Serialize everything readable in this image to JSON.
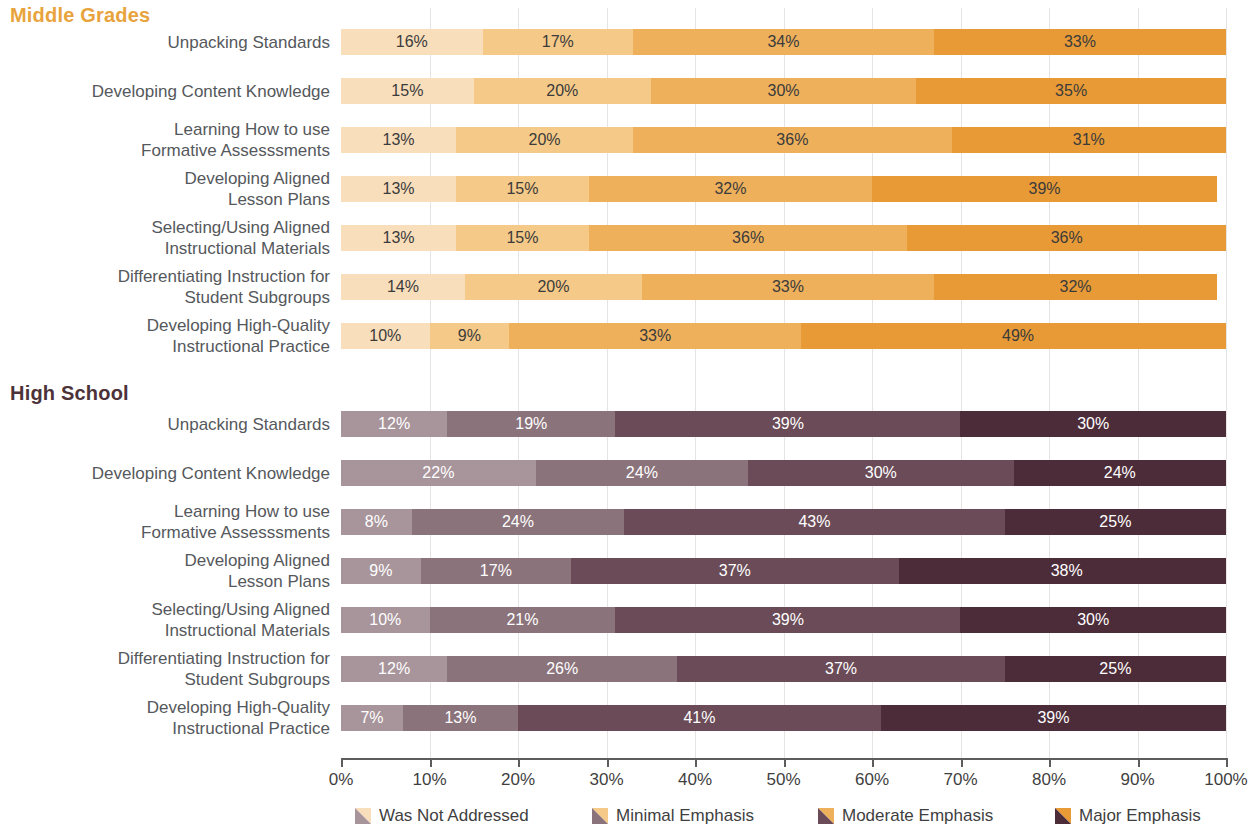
{
  "sections": [
    {
      "id": "middle-grades",
      "title": "Middle Grades",
      "title_color": "#e8a33d",
      "palette": [
        "#f8debb",
        "#f5c987",
        "#eeb05b",
        "#e79a36"
      ],
      "label_text_color": "#3b3b3b",
      "rows": [
        {
          "label": "Unpacking Standards",
          "values": [
            16,
            17,
            34,
            33
          ],
          "labels": [
            "16%",
            "17%",
            "34%",
            "33%"
          ]
        },
        {
          "label": "Developing Content Knowledge",
          "values": [
            15,
            20,
            30,
            35
          ],
          "labels": [
            "15%",
            "20%",
            "30%",
            "35%"
          ]
        },
        {
          "label": "Learning How to use\nFormative Assesssments",
          "values": [
            13,
            20,
            36,
            31
          ],
          "labels": [
            "13%",
            "20%",
            "36%",
            "31%"
          ]
        },
        {
          "label": "Developing Aligned\nLesson Plans",
          "values": [
            13,
            15,
            32,
            39
          ],
          "labels": [
            "13%",
            "15%",
            "32%",
            "39%"
          ]
        },
        {
          "label": "Selecting/Using Aligned\nInstructional Materials",
          "values": [
            13,
            15,
            36,
            36
          ],
          "labels": [
            "13%",
            "15%",
            "36%",
            "36%"
          ]
        },
        {
          "label": "Differentiating Instruction for\nStudent Subgroups",
          "values": [
            14,
            20,
            33,
            32
          ],
          "labels": [
            "14%",
            "20%",
            "33%",
            "32%"
          ]
        },
        {
          "label": "Developing High-Quality\nInstructional Practice",
          "values": [
            10,
            9,
            33,
            49
          ],
          "labels": [
            "10%",
            "9%",
            "33%",
            "49%"
          ]
        }
      ]
    },
    {
      "id": "high-school",
      "title": "High School",
      "title_color": "#4d3239",
      "palette": [
        "#a8959b",
        "#8b737b",
        "#6b4b57",
        "#4d2c39"
      ],
      "label_text_color": "#ffffff",
      "rows": [
        {
          "label": "Unpacking Standards",
          "values": [
            12,
            19,
            39,
            30
          ],
          "labels": [
            "12%",
            "19%",
            "39%",
            "30%"
          ]
        },
        {
          "label": "Developing Content Knowledge",
          "values": [
            22,
            24,
            30,
            24
          ],
          "labels": [
            "22%",
            "24%",
            "30%",
            "24%"
          ]
        },
        {
          "label": "Learning How to use\nFormative Assesssments",
          "values": [
            8,
            24,
            43,
            25
          ],
          "labels": [
            "8%",
            "24%",
            "43%",
            "25%"
          ]
        },
        {
          "label": "Developing Aligned\nLesson Plans",
          "values": [
            9,
            17,
            37,
            38
          ],
          "labels": [
            "9%",
            "17%",
            "37%",
            "38%"
          ]
        },
        {
          "label": "Selecting/Using Aligned\nInstructional Materials",
          "values": [
            10,
            21,
            39,
            30
          ],
          "labels": [
            "10%",
            "21%",
            "39%",
            "30%"
          ]
        },
        {
          "label": "Differentiating Instruction for\nStudent Subgroups",
          "values": [
            12,
            26,
            37,
            25
          ],
          "labels": [
            "12%",
            "26%",
            "37%",
            "25%"
          ]
        },
        {
          "label": "Developing High-Quality\nInstructional Practice",
          "values": [
            7,
            13,
            41,
            39
          ],
          "labels": [
            "7%",
            "13%",
            "41%",
            "39%"
          ]
        }
      ]
    }
  ],
  "axis": {
    "ticks": [
      0,
      10,
      20,
      30,
      40,
      50,
      60,
      70,
      80,
      90,
      100
    ],
    "tick_labels": [
      "0%",
      "10%",
      "20%",
      "30%",
      "40%",
      "50%",
      "60%",
      "70%",
      "80%",
      "90%",
      "100%"
    ]
  },
  "legend": {
    "items": [
      {
        "label": "Was Not Addressed",
        "orange": "#f8debb",
        "purple": "#a8959b"
      },
      {
        "label": "Minimal Emphasis",
        "orange": "#f5c987",
        "purple": "#8b737b"
      },
      {
        "label": "Moderate Emphasis",
        "orange": "#eeb05b",
        "purple": "#6b4b57"
      },
      {
        "label": "Major Emphasis",
        "orange": "#e79a36",
        "purple": "#4d2c39"
      }
    ]
  },
  "chart_data": {
    "type": "bar",
    "title": "",
    "xlabel": "",
    "ylabel": "",
    "xlim": [
      0,
      100
    ],
    "grid": true,
    "orientation": "horizontal",
    "stacked": true,
    "normalized_percent": true,
    "legend_position": "bottom",
    "series": [
      {
        "name": "Was Not Addressed"
      },
      {
        "name": "Minimal Emphasis"
      },
      {
        "name": "Moderate Emphasis"
      },
      {
        "name": "Major Emphasis"
      }
    ],
    "groups": [
      {
        "name": "Middle Grades",
        "categories": [
          "Unpacking Standards",
          "Developing Content Knowledge",
          "Learning How to use Formative Assesssments",
          "Developing Aligned Lesson Plans",
          "Selecting/Using Aligned Instructional Materials",
          "Differentiating Instruction for Student Subgroups",
          "Developing High-Quality Instructional Practice"
        ],
        "values": [
          [
            16,
            17,
            34,
            33
          ],
          [
            15,
            20,
            30,
            35
          ],
          [
            13,
            20,
            36,
            31
          ],
          [
            13,
            15,
            32,
            39
          ],
          [
            13,
            15,
            36,
            36
          ],
          [
            14,
            20,
            33,
            32
          ],
          [
            10,
            9,
            33,
            49
          ]
        ]
      },
      {
        "name": "High School",
        "categories": [
          "Unpacking Standards",
          "Developing Content Knowledge",
          "Learning How to use Formative Assesssments",
          "Developing Aligned Lesson Plans",
          "Selecting/Using Aligned Instructional Materials",
          "Differentiating Instruction for Student Subgroups",
          "Developing High-Quality Instructional Practice"
        ],
        "values": [
          [
            12,
            19,
            39,
            30
          ],
          [
            22,
            24,
            30,
            24
          ],
          [
            8,
            24,
            43,
            25
          ],
          [
            9,
            17,
            37,
            38
          ],
          [
            10,
            21,
            39,
            30
          ],
          [
            12,
            26,
            37,
            25
          ],
          [
            7,
            13,
            41,
            39
          ]
        ]
      }
    ],
    "xticks": [
      0,
      10,
      20,
      30,
      40,
      50,
      60,
      70,
      80,
      90,
      100
    ],
    "xticklabels": [
      "0%",
      "10%",
      "20%",
      "30%",
      "40%",
      "50%",
      "60%",
      "70%",
      "80%",
      "90%",
      "100%"
    ]
  }
}
